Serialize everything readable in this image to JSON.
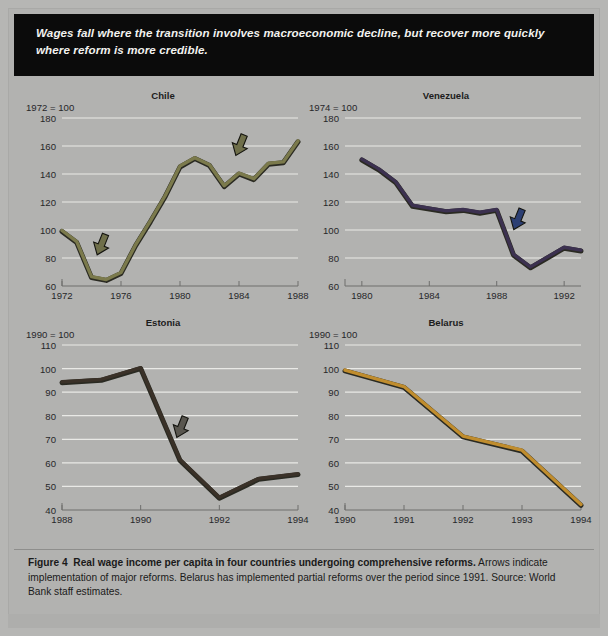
{
  "banner": {
    "text": "Wages fall where the transition involves macroeconomic decline, but recover more quickly where reform is more credible."
  },
  "caption": {
    "figure_label": "Figure 4",
    "bold_text": "Real wage income per capita in four countries undergoing comprehensive reforms.",
    "rest_text": " Arrows indicate implementation of major reforms. Belarus has implemented partial reforms over the period since 1991. Source: World Bank staff estimates."
  },
  "chart_data": [
    {
      "type": "line",
      "title": "Chile",
      "base_label": "1972 = 100",
      "xlabel": "",
      "ylabel": "",
      "xlim": [
        1972,
        1988
      ],
      "ylim": [
        60,
        180
      ],
      "xticks": [
        1972,
        1976,
        1980,
        1984,
        1988
      ],
      "xticklabels": [
        "1972",
        "1976",
        "1980",
        "1984",
        "1988"
      ],
      "yticks": [
        60,
        80,
        100,
        120,
        140,
        160,
        180
      ],
      "yticklabels": [
        "60",
        "80",
        "100",
        "120",
        "140",
        "160",
        "180"
      ],
      "grid": true,
      "legend": "none",
      "line_color": "#7b7a4c",
      "x": [
        1972,
        1973,
        1974,
        1975,
        1976,
        1977,
        1978,
        1979,
        1980,
        1981,
        1982,
        1983,
        1984,
        1985,
        1986,
        1987,
        1988
      ],
      "values": [
        99,
        91,
        66,
        64,
        69,
        89,
        106,
        124,
        145,
        151,
        146,
        131,
        140,
        136,
        147,
        148,
        163
      ],
      "annotations": [
        {
          "name": "reform-arrow-1",
          "x": 1974.6,
          "y": 86,
          "color": "#6f6f4a",
          "label": "major reform"
        },
        {
          "name": "reform-arrow-2",
          "x": 1984.0,
          "y": 157,
          "color": "#6f6f4a",
          "label": "major reform"
        }
      ]
    },
    {
      "type": "line",
      "title": "Venezuela",
      "base_label": "1974 = 100",
      "xlabel": "",
      "ylabel": "",
      "xlim": [
        1979,
        1993
      ],
      "ylim": [
        60,
        180
      ],
      "xticks": [
        1980,
        1984,
        1988,
        1992
      ],
      "xticklabels": [
        "1980",
        "1984",
        "1988",
        "1992"
      ],
      "yticks": [
        60,
        80,
        100,
        120,
        140,
        160,
        180
      ],
      "yticklabels": [
        "60",
        "80",
        "100",
        "120",
        "140",
        "160",
        "180"
      ],
      "grid": true,
      "legend": "none",
      "line_color": "#3c3150",
      "x": [
        1980,
        1981,
        1982,
        1983,
        1984,
        1985,
        1986,
        1987,
        1988,
        1989,
        1990,
        1991,
        1992,
        1993
      ],
      "values": [
        150,
        143,
        134,
        117,
        115,
        113,
        114,
        112,
        114,
        82,
        73,
        80,
        87,
        85
      ],
      "annotations": [
        {
          "name": "reform-arrow-1",
          "x": 1989.2,
          "y": 104,
          "color": "#2c3f73",
          "label": "major reform"
        }
      ]
    },
    {
      "type": "line",
      "title": "Estonia",
      "base_label": "1990 = 100",
      "xlabel": "",
      "ylabel": "",
      "xlim": [
        1988,
        1994
      ],
      "ylim": [
        40,
        110
      ],
      "xticks": [
        1988,
        1990,
        1992,
        1994
      ],
      "xticklabels": [
        "1988",
        "1990",
        "1992",
        "1994"
      ],
      "yticks": [
        40,
        50,
        60,
        70,
        80,
        90,
        100,
        110
      ],
      "yticklabels": [
        "40",
        "50",
        "60",
        "70",
        "80",
        "90",
        "100",
        "110"
      ],
      "grid": true,
      "legend": "none",
      "line_color": "#3a3128",
      "x": [
        1988,
        1989,
        1990,
        1991,
        1992,
        1993,
        1994
      ],
      "values": [
        94,
        95,
        100,
        61,
        45,
        53,
        55
      ],
      "annotations": [
        {
          "name": "reform-arrow-1",
          "x": 1991.0,
          "y": 73,
          "color": "#59564f",
          "label": "major reform"
        }
      ]
    },
    {
      "type": "line",
      "title": "Belarus",
      "base_label": "1990 = 100",
      "xlabel": "",
      "ylabel": "",
      "xlim": [
        1990,
        1994
      ],
      "ylim": [
        40,
        110
      ],
      "xticks": [
        1990,
        1991,
        1992,
        1993,
        1994
      ],
      "xticklabels": [
        "1990",
        "1991",
        "1992",
        "1993",
        "1994"
      ],
      "yticks": [
        40,
        50,
        60,
        70,
        80,
        90,
        100,
        110
      ],
      "yticklabels": [
        "40",
        "50",
        "60",
        "70",
        "80",
        "90",
        "100",
        "110"
      ],
      "grid": true,
      "legend": "none",
      "line_color": "#c08d2e",
      "x": [
        1990,
        1991,
        1992,
        1993,
        1994
      ],
      "values": [
        99,
        92,
        71,
        65,
        42
      ],
      "annotations": []
    }
  ],
  "colors": {
    "banner_bg": "#0b0b0b",
    "banner_text": "#f2f2ef",
    "page_bg": "#b6b6b4",
    "grid": "#e9e9e6",
    "axis": "#6e6e6c",
    "tick_text": "#27272a"
  }
}
